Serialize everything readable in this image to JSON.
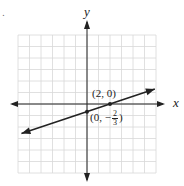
{
  "chart_data": {
    "type": "line",
    "title": "",
    "xlabel": "x",
    "ylabel": "y",
    "xlim": [
      -6,
      6
    ],
    "ylim": [
      -6,
      6
    ],
    "grid": true,
    "grid_step": 1,
    "series": [
      {
        "name": "line",
        "equation": "y = (1/3)x - 2/3",
        "slope": 0.3333,
        "intercept": -0.6667,
        "x": [
          -5.7,
          5.9
        ],
        "y": [
          -2.57,
          1.3
        ],
        "arrows": "both"
      }
    ],
    "points": [
      {
        "x": 2,
        "y": 0,
        "label": "(2, 0)"
      },
      {
        "x": 0,
        "y": -0.6667,
        "label_prefix": "(0, −",
        "label_num": "2",
        "label_den": "3",
        "label_suffix": ")"
      }
    ],
    "colors": {
      "grid": "#d8d8d8",
      "axis": "#222222",
      "line": "#222222"
    }
  },
  "labels": {
    "x_axis": "x",
    "y_axis": "y",
    "stray_mark": "."
  }
}
